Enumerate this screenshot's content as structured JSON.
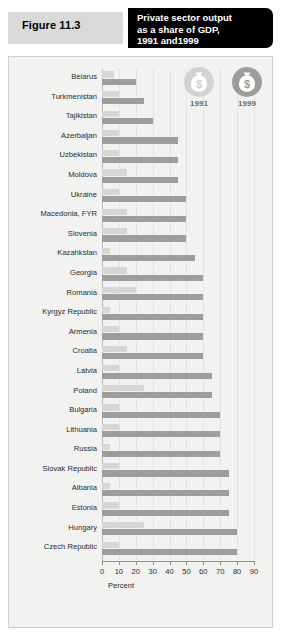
{
  "figure": {
    "number_label": "Figure 11.3",
    "title": "Private sector output as a share of GDP, 1991 and1999",
    "title_line1": "Private sector output",
    "title_line2": "as a share of GDP,",
    "title_line3": "1991 and1999"
  },
  "legend": {
    "items": [
      {
        "year": "1991",
        "icon": "money-bag-coin-icon",
        "color": "#d6d6d4"
      },
      {
        "year": "1999",
        "icon": "money-bag-coin-icon",
        "color": "#9d9d9b"
      }
    ]
  },
  "colors": {
    "series_1991": "#d6d6d4",
    "series_1999": "#9d9d9b",
    "panel_background": "#f2f2f0",
    "title_background": "#000000",
    "figure_box_background": "#d9d9d9"
  },
  "chart_data": {
    "type": "bar",
    "orientation": "horizontal",
    "title": "Private sector output as a share of GDP, 1991 and1999",
    "xlabel": "Percent",
    "ylabel": "",
    "xlim": [
      0,
      90
    ],
    "xticks": [
      0,
      10,
      20,
      30,
      40,
      50,
      60,
      70,
      80,
      90
    ],
    "grid": true,
    "legend_position": "top-right",
    "categories": [
      "Belarus",
      "Turkmenistan",
      "Tajikistan",
      "Azerbaijan",
      "Uzbekistan",
      "Moldova",
      "Ukraine",
      "Macedonia, FYR",
      "Slovenia",
      "Kazahkstan",
      "Georgia",
      "Romania",
      "Kyrgyz Republic",
      "Armenia",
      "Croatia",
      "Latvia",
      "Poland",
      "Bulgaria",
      "Lithuania",
      "Russia",
      "Slovak Republic",
      "Albania",
      "Estonia",
      "Hungary",
      "Czech Republic"
    ],
    "series": [
      {
        "name": "1991",
        "color": "#d6d6d4",
        "values": [
          7,
          10,
          10,
          10,
          10,
          15,
          10,
          15,
          15,
          5,
          15,
          20,
          5,
          10,
          15,
          10,
          25,
          10,
          10,
          5,
          10,
          5,
          10,
          25,
          10
        ]
      },
      {
        "name": "1999",
        "color": "#9d9d9b",
        "values": [
          20,
          25,
          30,
          45,
          45,
          45,
          50,
          50,
          50,
          55,
          60,
          60,
          60,
          60,
          60,
          65,
          65,
          70,
          70,
          70,
          75,
          75,
          75,
          80,
          80
        ]
      }
    ]
  }
}
